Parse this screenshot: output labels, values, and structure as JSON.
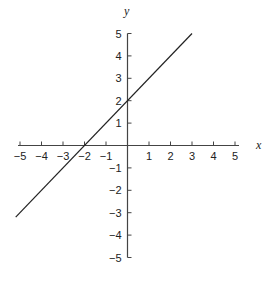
{
  "chart_data": {
    "type": "line",
    "title": "",
    "xlabel": "x",
    "ylabel": "y",
    "xlim": [
      -5,
      5
    ],
    "ylim": [
      -5,
      5
    ],
    "grid": false,
    "legend": null,
    "x_ticks": [
      -5,
      -4,
      -3,
      -2,
      -1,
      1,
      2,
      3,
      4,
      5
    ],
    "y_ticks": [
      -5,
      -4,
      -3,
      -2,
      -1,
      1,
      2,
      3,
      4,
      5
    ],
    "x_tick_labels": [
      "−5",
      "−4",
      "−3",
      "−2",
      "−1",
      "1",
      "2",
      "3",
      "4",
      "5"
    ],
    "y_tick_labels": [
      "−5",
      "−4",
      "−3",
      "−2",
      "−1",
      "1",
      "2",
      "3",
      "4",
      "5"
    ],
    "series": [
      {
        "name": "y = x + 2",
        "equation": "y = x + 2",
        "x": [
          -5.2,
          3
        ],
        "y": [
          -3.2,
          5
        ],
        "color": "#222222"
      }
    ],
    "annotations": []
  },
  "style": {
    "axis_color": "#444444",
    "line_color": "#222222"
  }
}
